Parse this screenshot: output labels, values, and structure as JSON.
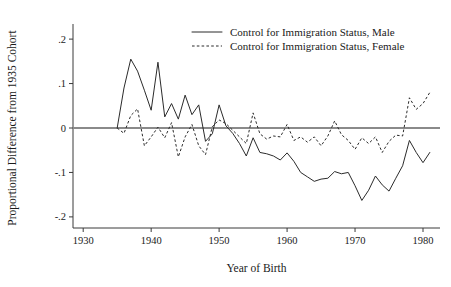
{
  "chart_data": {
    "type": "line",
    "title": "",
    "xlabel": "Year of Birth",
    "ylabel": "Proportional Difference from 1935 Cohort",
    "xlim": [
      1928.5,
      1982.5
    ],
    "ylim": [
      -0.225,
      0.225
    ],
    "xticks": [
      1930,
      1940,
      1950,
      1960,
      1970,
      1980
    ],
    "xticklabels": [
      "1930",
      "1940",
      "1950",
      "1960",
      "1970",
      "1980"
    ],
    "yticks": [
      0.2,
      0.1,
      0,
      -0.1,
      -0.2
    ],
    "yticklabels": [
      ".2",
      ".1",
      "0",
      "-.1",
      "-.2"
    ],
    "grid": false,
    "legend_position": "top-center",
    "zero_reference_line": 0,
    "x": [
      1935,
      1936,
      1937,
      1938,
      1939,
      1940,
      1941,
      1942,
      1943,
      1944,
      1945,
      1946,
      1947,
      1948,
      1949,
      1950,
      1951,
      1952,
      1953,
      1954,
      1955,
      1956,
      1957,
      1958,
      1959,
      1960,
      1961,
      1962,
      1963,
      1964,
      1965,
      1966,
      1967,
      1968,
      1969,
      1970,
      1971,
      1972,
      1973,
      1974,
      1975,
      1976,
      1977,
      1978,
      1979,
      1980,
      1981
    ],
    "series": [
      {
        "name": "Control for Immigration Status, Male",
        "style": "solid",
        "color": "#2b2b2b",
        "values": [
          0.0,
          0.09,
          0.155,
          0.128,
          0.085,
          0.04,
          0.148,
          0.025,
          0.055,
          0.02,
          0.074,
          0.03,
          0.052,
          -0.03,
          -0.013,
          0.052,
          0.005,
          -0.012,
          -0.035,
          -0.063,
          -0.022,
          -0.055,
          -0.058,
          -0.063,
          -0.072,
          -0.056,
          -0.075,
          -0.1,
          -0.11,
          -0.12,
          -0.115,
          -0.113,
          -0.098,
          -0.103,
          -0.1,
          -0.13,
          -0.163,
          -0.14,
          -0.108,
          -0.128,
          -0.142,
          -0.113,
          -0.085,
          -0.028,
          -0.055,
          -0.078,
          -0.055
        ]
      },
      {
        "name": "Control for Immigration Status, Female",
        "style": "dashed",
        "color": "#2b2b2b",
        "values": [
          0.0,
          -0.012,
          0.028,
          0.043,
          -0.04,
          -0.02,
          0.002,
          -0.022,
          0.012,
          -0.065,
          -0.02,
          0.008,
          -0.04,
          -0.06,
          0.003,
          0.018,
          0.01,
          -0.005,
          -0.02,
          -0.035,
          0.034,
          -0.013,
          -0.025,
          -0.018,
          -0.02,
          0.008,
          -0.028,
          -0.02,
          -0.032,
          -0.02,
          -0.04,
          -0.018,
          0.016,
          -0.015,
          -0.028,
          -0.048,
          -0.022,
          -0.035,
          -0.02,
          -0.055,
          -0.03,
          -0.016,
          -0.018,
          0.068,
          0.042,
          0.055,
          0.08
        ]
      }
    ],
    "legend": [
      {
        "label": "Control for Immigration Status, Male",
        "style": "solid"
      },
      {
        "label": "Control for Immigration Status, Female",
        "style": "dashed"
      }
    ]
  }
}
